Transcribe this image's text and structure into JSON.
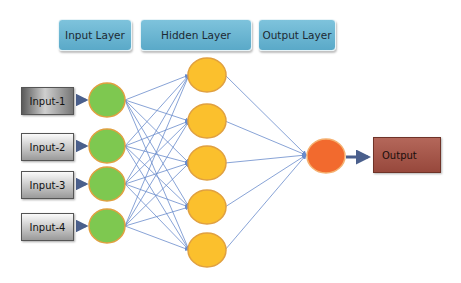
{
  "headers": {
    "input_layer": "Input Layer",
    "hidden_layer": "Hidden Layer",
    "output_layer": "Output Layer"
  },
  "inputs": [
    "Input-1",
    "Input-2",
    "Input-3",
    "Input-4"
  ],
  "output_label": "Output",
  "colors": {
    "header_fill": "#6ab4d2",
    "input_node": "#7ec850",
    "hidden_node": "#fbc02d",
    "output_node": "#f26a2e",
    "node_border": "#e0a040",
    "connection": "#6a8ccc",
    "output_box": "#a5574a"
  },
  "layers": {
    "input_nodes": 4,
    "hidden_nodes": 5,
    "output_nodes": 1
  }
}
